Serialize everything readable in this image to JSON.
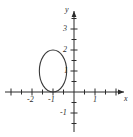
{
  "figure": {
    "width": 133,
    "height": 137,
    "background_color": "#ffffff",
    "ink_color": "#2b2b2b",
    "curve_color": "#3a3a3a"
  },
  "axes": {
    "x_axis_label": "x",
    "y_axis_label": "y",
    "origin_px": {
      "x": 74,
      "y": 92
    },
    "unit_px": {
      "x": 21,
      "y": 21
    },
    "x_range": [
      -3.4,
      2.6
    ],
    "y_range": [
      -1.9,
      4.1
    ],
    "x_labeled_ticks": [
      {
        "value": -2,
        "label": "-2"
      },
      {
        "value": -1,
        "label": "-1"
      },
      {
        "value": 1,
        "label": "1"
      }
    ],
    "y_labeled_ticks": [
      {
        "value": 3,
        "label": "3"
      },
      {
        "value": 2,
        "label": "2"
      },
      {
        "value": 1,
        "label": "1"
      },
      {
        "value": -1,
        "label": "-1"
      }
    ],
    "x_minor_tick_values": [
      -3,
      -2.5,
      -2,
      -1.5,
      -1,
      -0.5,
      0.5,
      1,
      1.5,
      2
    ],
    "y_minor_tick_values": [
      -1.5,
      -1,
      -0.5,
      0.5,
      1,
      1.5,
      2,
      2.5,
      3,
      3.5
    ],
    "arrow_heads": [
      "x-positive",
      "y-positive"
    ],
    "grid": "off"
  },
  "chart_data": {
    "type": "line",
    "title": "",
    "xlabel": "x",
    "ylabel": "y",
    "xlim": [
      -3.4,
      2.6
    ],
    "ylim": [
      -1.9,
      4.1
    ],
    "grid": false,
    "legend": "none",
    "series": [
      {
        "name": "closed-curve",
        "shape": "ellipse",
        "center": [
          -1,
          1
        ],
        "semi_axis_x": 0.65,
        "semi_axis_y": 1.0,
        "closed": true,
        "tangent_points": [
          {
            "x": -1,
            "y": 0,
            "note": "touches x-axis"
          },
          {
            "x": -1,
            "y": 2,
            "note": "top of curve"
          },
          {
            "x": -1.65,
            "y": 1,
            "note": "left of curve"
          },
          {
            "x": -0.35,
            "y": 1,
            "note": "right of curve"
          }
        ]
      }
    ]
  }
}
